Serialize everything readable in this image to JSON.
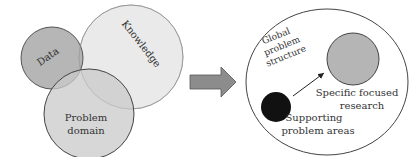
{
  "diagram": {
    "left_venn": {
      "circles": [
        {
          "id": "data",
          "label": "Data",
          "fill": "#a9a9a9"
        },
        {
          "id": "knowledge",
          "label": "Knowledge",
          "fill": "#e6e6e6"
        },
        {
          "id": "problem_domain",
          "label_line1": "Problem",
          "label_line2": "domain",
          "fill": "#c9c9c9"
        }
      ]
    },
    "transition_arrow": {
      "fill": "#8c8c8c"
    },
    "right_structure": {
      "outer_label_line1": "Global",
      "outer_label_line2": "problem",
      "outer_label_line3": "structure",
      "focused": {
        "label_line1": "Specific focused",
        "label_line2": "research",
        "fill": "#b5b5b5"
      },
      "supporting": {
        "label_line1": "Supporting",
        "label_line2": "problem areas",
        "fill": "#111111"
      }
    }
  }
}
